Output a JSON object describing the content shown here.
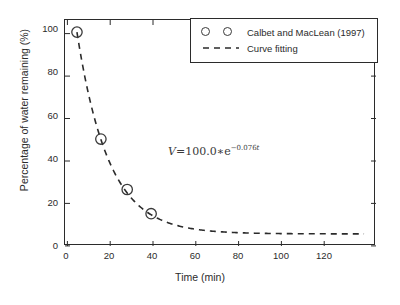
{
  "chart_data": {
    "type": "scatter",
    "title": "",
    "xlabel": "Time (min)",
    "ylabel": "Percentage of water remaining (%)",
    "xlim": [
      -5,
      125
    ],
    "ylim": [
      -6,
      106
    ],
    "xticks": [
      0,
      20,
      40,
      60,
      80,
      100,
      120
    ],
    "yticks": [
      0,
      20,
      40,
      60,
      80,
      100
    ],
    "grid": false,
    "legend_position": "upper right",
    "series": [
      {
        "name": "Calbet and MacLean (1997)",
        "type": "scatter",
        "marker": "open-circle",
        "color": "#3a3a3a",
        "x": [
          0,
          10,
          21,
          31
        ],
        "y": [
          100,
          47,
          22,
          10
        ]
      },
      {
        "name": "Curve fitting",
        "type": "line",
        "style": "dashed",
        "color": "#2b2b2b",
        "equation": "V = 100.0 * e^(-0.076t)",
        "amplitude": 100.0,
        "rate": 0.076,
        "x_range": [
          0,
          120
        ]
      }
    ],
    "annotations": [
      {
        "name": "fit-equation",
        "text": "V=100.0*e^{-0.076t}",
        "x": 32,
        "y": 38
      }
    ]
  },
  "axes": {
    "x_tick_labels": [
      "0",
      "20",
      "40",
      "60",
      "80",
      "100",
      "120"
    ],
    "y_tick_labels": [
      "0",
      "20",
      "40",
      "60",
      "80",
      "100"
    ],
    "x_title": "Time (min)",
    "y_title": "Percentage of water remaining (%)"
  },
  "legend": {
    "entries": [
      {
        "label": "Calbet and MacLean (1997)",
        "handle": "double-open-circle"
      },
      {
        "label": "Curve fitting",
        "handle": "dashed-line"
      }
    ]
  },
  "equation": {
    "variable": "V",
    "equals": "=",
    "coefficient": "100.0",
    "times": "∗",
    "base": "e",
    "exponent_sign": "−",
    "exponent_value": "0.076",
    "exponent_var": "t"
  },
  "colors": {
    "axis": "#2b2b2b",
    "marker": "#3a3a3a",
    "curve": "#2b2b2b",
    "background": "#ffffff",
    "annotation": "#3a3a3a"
  }
}
